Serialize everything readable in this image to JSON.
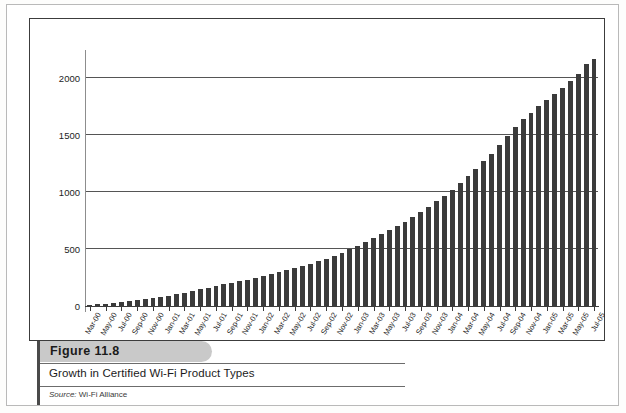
{
  "figure": {
    "banner_label": "Figure 11.8",
    "title": "Growth in Certified Wi-Fi Product Types",
    "source_prefix": "Source:",
    "source_value": " Wi-Fi Alliance"
  },
  "colors": {
    "bar": "#3b3b3b",
    "gridline": "#555555",
    "banner": "#c9c9c9",
    "frame": "#3c3c3c"
  },
  "chart_data": {
    "type": "bar",
    "title": "Growth in Certified Wi-Fi Product Types",
    "xlabel": "",
    "ylabel": "",
    "ylim": [
      0,
      2250
    ],
    "yticks": [
      0,
      500,
      1000,
      1500,
      2000
    ],
    "ytick_labels": [
      "0",
      "500",
      "1000",
      "1500",
      "2000"
    ],
    "grid": true,
    "legend": "none",
    "categories": [
      "Mar-00",
      "Apr-00",
      "May-00",
      "Jun-00",
      "Jul-00",
      "Aug-00",
      "Sep-00",
      "Oct-00",
      "Nov-00",
      "Dec-00",
      "Jan-01",
      "Feb-01",
      "Mar-01",
      "Apr-01",
      "May-01",
      "Jun-01",
      "Jul-01",
      "Aug-01",
      "Sep-01",
      "Oct-01",
      "Nov-01",
      "Dec-01",
      "Jan-02",
      "Feb-02",
      "Mar-02",
      "Apr-02",
      "May-02",
      "Jun-02",
      "Jul-02",
      "Aug-02",
      "Sep-02",
      "Oct-02",
      "Nov-02",
      "Dec-02",
      "Jan-03",
      "Feb-03",
      "Mar-03",
      "Apr-03",
      "May-03",
      "Jun-03",
      "Jul-03",
      "Aug-03",
      "Sep-03",
      "Oct-03",
      "Nov-03",
      "Dec-03",
      "Jan-04",
      "Feb-04",
      "Mar-04",
      "Apr-04",
      "May-04",
      "Jun-04",
      "Jul-04",
      "Aug-04",
      "Sep-04",
      "Oct-04",
      "Nov-04",
      "Dec-04",
      "Jan-05",
      "Feb-05",
      "Mar-05",
      "Apr-05",
      "May-05",
      "Jun-05",
      "Jul-05"
    ],
    "tick_labels_shown": [
      "Mar-00",
      "May-00",
      "Jul-00",
      "Sep-00",
      "Nov-00",
      "Jan-01",
      "Mar-01",
      "May-01",
      "Jul-01",
      "Sep-01",
      "Nov-01",
      "Jan-02",
      "Mar-02",
      "May-02",
      "Jul-02",
      "Sep-02",
      "Nov-02",
      "Jan-03",
      "Mar-03",
      "May-03",
      "Jul-03",
      "Sep-03",
      "Nov-03",
      "Jan-04",
      "Mar-04",
      "May-04",
      "Jul-04",
      "Sep-04",
      "Nov-04",
      "Jan-05",
      "Mar-05",
      "May-05",
      "Jul-05"
    ],
    "values": [
      8,
      14,
      20,
      28,
      36,
      44,
      52,
      60,
      70,
      80,
      92,
      104,
      118,
      132,
      146,
      160,
      175,
      190,
      205,
      218,
      232,
      246,
      262,
      278,
      296,
      315,
      334,
      352,
      372,
      392,
      415,
      440,
      468,
      498,
      530,
      562,
      596,
      630,
      664,
      700,
      740,
      782,
      826,
      872,
      920,
      970,
      1022,
      1078,
      1140,
      1205,
      1272,
      1340,
      1412,
      1490,
      1572,
      1640,
      1700,
      1756,
      1812,
      1866,
      1920,
      1980,
      2042,
      2130,
      2175
    ]
  }
}
